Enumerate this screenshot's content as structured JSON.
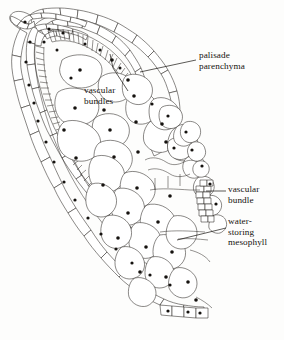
{
  "figure": {
    "background_color": "#fdfdfc",
    "ink_color": "#2a2723",
    "nucleus_color": "#15120f",
    "labels": [
      {
        "id": "palisade",
        "text": "palisade\nparenchyma",
        "x": 199,
        "y": 50,
        "leader": "M197,61 L139,72"
      },
      {
        "id": "vascular_bundles",
        "text": "vascular\nbundles",
        "x": 84,
        "y": 85,
        "leader": "M129,90 L112,68 M112,68 L110,55"
      },
      {
        "id": "vascular_bundle",
        "text": "vascular\nbundle",
        "x": 228,
        "y": 184,
        "leader": "M226,191 L205,191"
      },
      {
        "id": "water_storing_mesophyll",
        "text": "water-\nstoring\nmesophyll",
        "x": 228,
        "y": 216,
        "leader": "M226,228 L178,239"
      }
    ],
    "regions": [
      {
        "name": "epidermis",
        "description": "outer single layer of rounded cells forming the leaf margin"
      },
      {
        "name": "palisade-parenchyma",
        "description": "dense band of elongated striated cells beneath the epidermis"
      },
      {
        "name": "water-storing-mesophyll",
        "description": "large polygonal thin-walled cells filling the leaf interior"
      },
      {
        "name": "vascular-bundles",
        "description": "clusters of small tightly packed cells"
      }
    ]
  }
}
